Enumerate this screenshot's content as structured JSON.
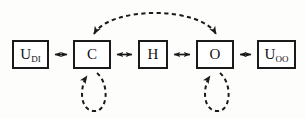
{
  "diagram": {
    "background_color": "#fdfdfc",
    "stroke_color": "#1a1a1a",
    "nodes": [
      {
        "id": "u-di",
        "base": "U",
        "subscript": "DI",
        "x": 12,
        "y": 40,
        "width": 37,
        "height": 29
      },
      {
        "id": "c",
        "base": "C",
        "subscript": "",
        "x": 73,
        "y": 40,
        "width": 38,
        "height": 29
      },
      {
        "id": "h",
        "base": "H",
        "subscript": "",
        "x": 138,
        "y": 40,
        "width": 30,
        "height": 29
      },
      {
        "id": "o",
        "base": "O",
        "subscript": "",
        "x": 196,
        "y": 40,
        "width": 38,
        "height": 29
      },
      {
        "id": "u-oo",
        "base": "U",
        "subscript": "OO",
        "x": 257,
        "y": 40,
        "width": 39,
        "height": 29
      }
    ],
    "connectors": [
      {
        "id": "udi-c",
        "style": "solid",
        "arrows": "both",
        "from": "u-di",
        "to": "c"
      },
      {
        "id": "c-h",
        "style": "solid",
        "arrows": "both",
        "from": "c",
        "to": "h"
      },
      {
        "id": "h-o",
        "style": "solid",
        "arrows": "both",
        "from": "h",
        "to": "o"
      },
      {
        "id": "o-uoo",
        "style": "solid",
        "arrows": "both",
        "from": "o",
        "to": "u-oo"
      },
      {
        "id": "c-o-arc",
        "style": "dashed",
        "arrows": "both",
        "from": "c",
        "to": "o"
      },
      {
        "id": "c-self-loop",
        "style": "dashed",
        "arrows": "single",
        "from": "c",
        "to": "c"
      },
      {
        "id": "o-self-loop",
        "style": "dashed",
        "arrows": "single",
        "from": "o",
        "to": "o"
      }
    ]
  }
}
